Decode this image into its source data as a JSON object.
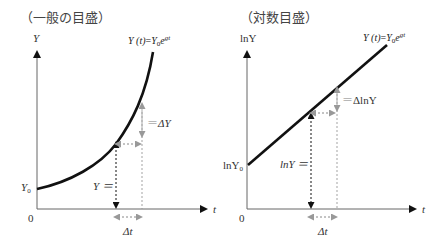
{
  "left_chart": {
    "title": "（一般の目盛）",
    "y_axis_label": "Y",
    "x_axis_label": "t",
    "origin_label": "0",
    "y0_label": "Y",
    "y0_sub": "0",
    "formula": {
      "lhs": "Y (t)",
      "eq": "=",
      "rhs_base": "Y",
      "rhs_sub": "0",
      "rhs_e": "e",
      "rhs_exp": "gt"
    },
    "delta_y_label": "ΔY",
    "level_label": "Y ＝",
    "delta_t_label": "Δt",
    "curve_type": "exponential"
  },
  "right_chart": {
    "title": "（対数目盛）",
    "y_axis_label": "lnY",
    "x_axis_label": "t",
    "origin_label": "0",
    "y0_label": "lnY",
    "y0_sub": "0",
    "formula": {
      "lhs": "Y (t)",
      "eq": "=",
      "rhs_base": "Y",
      "rhs_sub": "0",
      "rhs_e": "e",
      "rhs_exp": "gt"
    },
    "delta_y_label": "ΔlnY",
    "level_label": "lnY ＝",
    "delta_t_label": "Δt",
    "curve_type": "linear"
  },
  "colors": {
    "curve": "#111111",
    "axis": "#555555",
    "guide_black": "#111111",
    "guide_gray": "#a8a8a8",
    "text": "#333333"
  }
}
